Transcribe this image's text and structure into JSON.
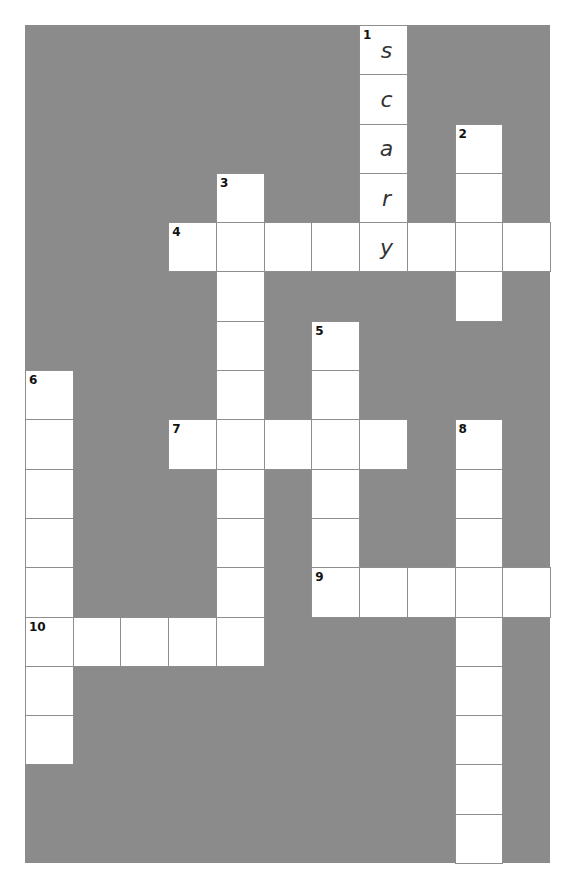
{
  "puzzle": {
    "type": "crossword",
    "rows": 17,
    "cols": 11,
    "colors": {
      "block": "#8b8b8b",
      "cell": "#ffffff",
      "line": "#8e8e8e"
    },
    "words": [
      {
        "number": "1",
        "direction": "down",
        "row": 0,
        "col": 7,
        "length": 5,
        "answer": "scary"
      },
      {
        "number": "2",
        "direction": "down",
        "row": 2,
        "col": 9,
        "length": 4,
        "answer": ""
      },
      {
        "number": "3",
        "direction": "down",
        "row": 3,
        "col": 4,
        "length": 10,
        "answer": ""
      },
      {
        "number": "4",
        "direction": "across",
        "row": 4,
        "col": 3,
        "length": 8,
        "answer": ""
      },
      {
        "number": "5",
        "direction": "down",
        "row": 6,
        "col": 6,
        "length": 6,
        "answer": ""
      },
      {
        "number": "6",
        "direction": "down",
        "row": 7,
        "col": 0,
        "length": 8,
        "answer": ""
      },
      {
        "number": "7",
        "direction": "across",
        "row": 8,
        "col": 3,
        "length": 5,
        "answer": ""
      },
      {
        "number": "8",
        "direction": "down",
        "row": 8,
        "col": 9,
        "length": 9,
        "answer": ""
      },
      {
        "number": "9",
        "direction": "across",
        "row": 11,
        "col": 6,
        "length": 5,
        "answer": ""
      },
      {
        "number": "10",
        "direction": "across",
        "row": 12,
        "col": 0,
        "length": 5,
        "answer": ""
      }
    ]
  }
}
